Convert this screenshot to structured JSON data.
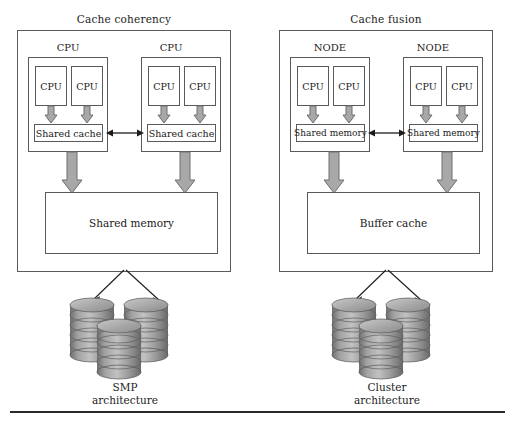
{
  "figure": {
    "type": "architecture-diagram"
  },
  "panels": [
    {
      "id": "cache-coherency",
      "title": "Cache coherency",
      "group_label": "CPU",
      "groups": [
        {
          "label": "CPU",
          "cpus": [
            "CPU",
            "CPU"
          ],
          "share_label": "Shared cache"
        },
        {
          "label": "CPU",
          "cpus": [
            "CPU",
            "CPU"
          ],
          "share_label": "Shared cache"
        }
      ],
      "memory_label": "Shared memory",
      "caption_line1": "SMP",
      "caption_line2": "architecture",
      "interconnect": "bidirectional-arrow"
    },
    {
      "id": "cache-fusion",
      "title": "Cache fusion",
      "group_label": "NODE",
      "groups": [
        {
          "label": "NODE",
          "cpus": [
            "CPU",
            "CPU"
          ],
          "share_label": "Shared memory"
        },
        {
          "label": "NODE",
          "cpus": [
            "CPU",
            "CPU"
          ],
          "share_label": "Shared memory"
        }
      ],
      "memory_label": "Buffer cache",
      "caption_line1": "Cluster",
      "caption_line2": "architecture",
      "interconnect": "bidirectional-arrow"
    }
  ],
  "colors": {
    "stroke": "#5a5a5a",
    "text": "#1c1c1c",
    "arrow_fill": "#a8a8a8",
    "arrow_stroke": "#6e6e6e",
    "disk_fill": "#9a9a9a",
    "disk_top": "#b5b5b5",
    "rule": "#2a2a2a",
    "background": "#ffffff"
  }
}
